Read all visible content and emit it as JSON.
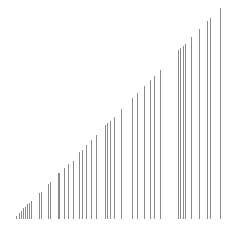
{
  "chart_data": {
    "type": "bar",
    "style": "vertical-lines",
    "title": "",
    "xlabel": "",
    "ylabel": "",
    "grid": false,
    "legend": null,
    "baseline_y_px": 219,
    "line_color": "#8a8a8a",
    "x": [
      16,
      19,
      21,
      23,
      25,
      27,
      29,
      31,
      39,
      41,
      48,
      50,
      58,
      59,
      64,
      68,
      73,
      79,
      82,
      86,
      91,
      96,
      105,
      107,
      110,
      114,
      121,
      132,
      137,
      144,
      150,
      154,
      160,
      178,
      180,
      183,
      185,
      191,
      199,
      207,
      210,
      220
    ],
    "values": [
      3,
      6,
      8,
      11,
      12,
      15,
      16,
      18,
      26,
      27,
      35,
      37,
      46,
      46,
      51,
      55,
      58,
      67,
      69,
      74,
      79,
      84,
      94,
      96,
      98,
      102,
      110,
      121,
      126,
      133,
      139,
      143,
      149,
      169,
      171,
      173,
      175,
      182,
      190,
      198,
      201,
      211
    ]
  }
}
